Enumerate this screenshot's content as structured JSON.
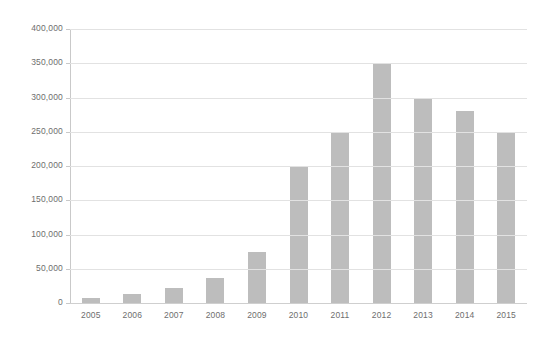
{
  "chart_data": {
    "type": "bar",
    "title": "",
    "subtitle": "",
    "xlabel": "",
    "ylabel": "",
    "categories": [
      "2005",
      "2006",
      "2007",
      "2008",
      "2009",
      "2010",
      "2011",
      "2012",
      "2013",
      "2014",
      "2015"
    ],
    "values": [
      8000,
      13000,
      22000,
      37000,
      75000,
      200000,
      250000,
      350000,
      300000,
      280000,
      250000
    ],
    "ylim": [
      0,
      400000
    ],
    "y_ticks": [
      0,
      50000,
      100000,
      150000,
      200000,
      250000,
      300000,
      350000,
      400000
    ],
    "y_tick_labels": [
      "0",
      "50,000",
      "100,000",
      "150,000",
      "200,000",
      "250,000",
      "300,000",
      "350,000",
      "400,000"
    ],
    "grid": true,
    "grid_axis": "y",
    "legend": false,
    "legend_position": "none",
    "annotations": [],
    "bar_color": "#bdbdbd",
    "gridline_color": "#e2e2e2",
    "axis_color": "#c9c9c9",
    "label_color": "#6e6e6e",
    "background_color": "#ffffff"
  }
}
